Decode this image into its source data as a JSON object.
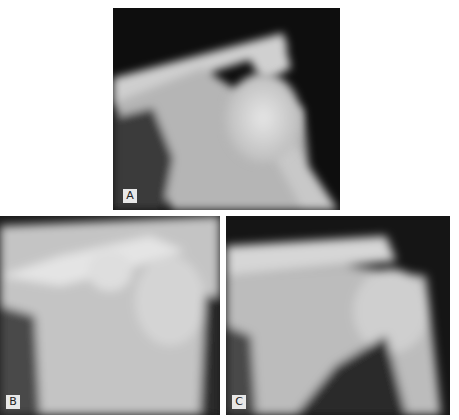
{
  "figure": {
    "panels": [
      {
        "id": "A",
        "label": "A",
        "description": "Shoulder radiograph, anteroposterior view"
      },
      {
        "id": "B",
        "label": "B",
        "description": "Shoulder radiograph, anteroposterior view"
      },
      {
        "id": "C",
        "label": "C",
        "description": "Shoulder radiograph, anteroposterior view"
      }
    ]
  }
}
